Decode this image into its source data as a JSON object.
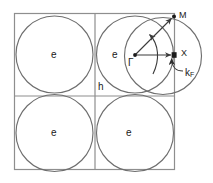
{
  "figure": {
    "kind": "brillouin-zone-fermi-surface-diagram",
    "background_color": "#ffffff",
    "line_color": "#595959",
    "frame_color": "#8a8a8a",
    "marker_color": "#1a1a1a",
    "text_color": "#1a1a1a",
    "width": 213,
    "height": 183
  },
  "zone": {
    "frame": {
      "x": 14,
      "y": 13,
      "width": 161,
      "height": 157
    },
    "divider_x": 95,
    "divider_y": 96
  },
  "pockets": [
    {
      "id": "upper-left",
      "label": "e",
      "label_x": 51,
      "label_y": 50,
      "cx": 54.5,
      "cy": 54.5,
      "r": 38.5
    },
    {
      "id": "upper-right",
      "label": "e",
      "label_x": 112,
      "label_y": 50,
      "cx": 135.0,
      "cy": 54.5,
      "r": 38.5
    },
    {
      "id": "lower-left",
      "label": "e",
      "label_x": 51,
      "label_y": 131,
      "cx": 54.5,
      "cy": 133.0,
      "r": 38.5
    },
    {
      "id": "lower-right",
      "label": "e",
      "label_x": 126,
      "label_y": 131,
      "cx": 135.0,
      "cy": 133.0,
      "r": 38.5
    }
  ],
  "hole_region": {
    "label": "h",
    "label_x": 98,
    "label_y": 83,
    "arc_cx": 163.0,
    "arc_cy": 56.0,
    "arc_r": 38.5
  },
  "high_symmetry_points": [
    {
      "name": "gamma",
      "label": "Γ",
      "x": 135,
      "y": 55,
      "marker": "dot",
      "label_x": 128,
      "label_y": 60
    },
    {
      "name": "M",
      "label": "M",
      "x": 174,
      "y": 16,
      "marker": "dot",
      "label_x": 178,
      "label_y": 10
    },
    {
      "name": "X",
      "label": "X",
      "x": 174,
      "y": 55,
      "marker": "square",
      "label_x": 180,
      "label_y": 50
    }
  ],
  "annotations": {
    "fermi_wavevector": {
      "label": "k",
      "subscript": "F",
      "label_x": 185,
      "label_y": 74
    }
  },
  "arrows": [
    {
      "name": "gamma-to-M",
      "from": [
        135,
        55
      ],
      "to": [
        172,
        18
      ]
    },
    {
      "name": "gamma-to-X",
      "from": [
        135,
        55
      ],
      "to": [
        172,
        55
      ]
    },
    {
      "name": "arc-arrow",
      "from": [
        152,
        70
      ],
      "to": [
        148,
        33
      ]
    },
    {
      "name": "kf-leader",
      "from": [
        182,
        70
      ],
      "to": [
        172,
        57
      ]
    }
  ]
}
